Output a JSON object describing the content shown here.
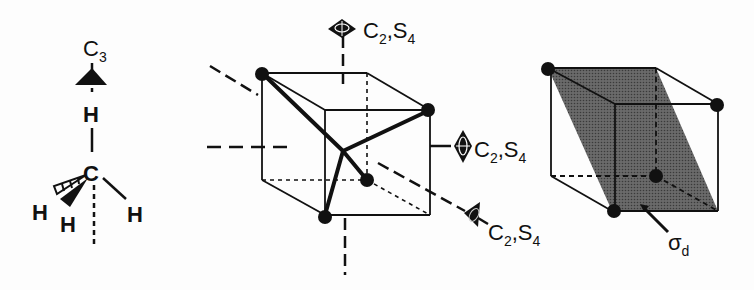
{
  "figure": {
    "methane": {
      "axis_label": "C",
      "axis_order": "3",
      "atoms": {
        "top_h": "H",
        "center_c": "C",
        "left_h": "H",
        "front_h": "H",
        "right_h": "H"
      }
    },
    "cube_axes": {
      "axes": [
        {
          "label_main": "C",
          "label_sub": "2",
          "label_sep": ",S",
          "label_sub2": "4",
          "position": "top"
        },
        {
          "label_main": "C",
          "label_sub": "2",
          "label_sep": ",S",
          "label_sub2": "4",
          "position": "right"
        },
        {
          "label_main": "C",
          "label_sub": "2",
          "label_sep": ",S",
          "label_sub2": "4",
          "position": "diagonal"
        }
      ]
    },
    "mirror_plane": {
      "label_main": "σ",
      "label_sub": "d"
    },
    "colors": {
      "ink": "#111111",
      "plane_fill": "#555555",
      "background": "#fdfdfd"
    }
  }
}
